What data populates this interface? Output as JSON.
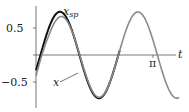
{
  "chart_data": {
    "type": "line",
    "title": "",
    "xlabel": "t",
    "ylabel": "",
    "xlim": [
      0,
      3.9
    ],
    "ylim": [
      -0.95,
      0.95
    ],
    "x_ticks": [
      {
        "value": 3.14159,
        "label": "π"
      }
    ],
    "y_ticks": [
      {
        "value": 0.5,
        "label": "0.5"
      },
      {
        "value": -0.5,
        "label": "-0.5"
      }
    ],
    "grid": false,
    "series": [
      {
        "name": "x_sp",
        "label": "x",
        "subscript": "sp",
        "color": "#111111",
        "width": 2.0,
        "description": "setpoint sinusoid, amplitude 0.8, angular frequency ~3, phase -0.36",
        "amplitude": 0.8,
        "omega": 3.0,
        "phase": -0.36
      },
      {
        "name": "x",
        "label": "x",
        "color": "#888888",
        "width": 1.6,
        "description": "response converging to setpoint; smaller first peak (~0.55)",
        "first_peak": 0.55
      }
    ]
  },
  "labels": {
    "xsp": "x",
    "xsp_sub": "sp",
    "x": "x",
    "t": "t",
    "pi": "π",
    "y_pos": "0.5",
    "y_neg": "−0.5"
  }
}
